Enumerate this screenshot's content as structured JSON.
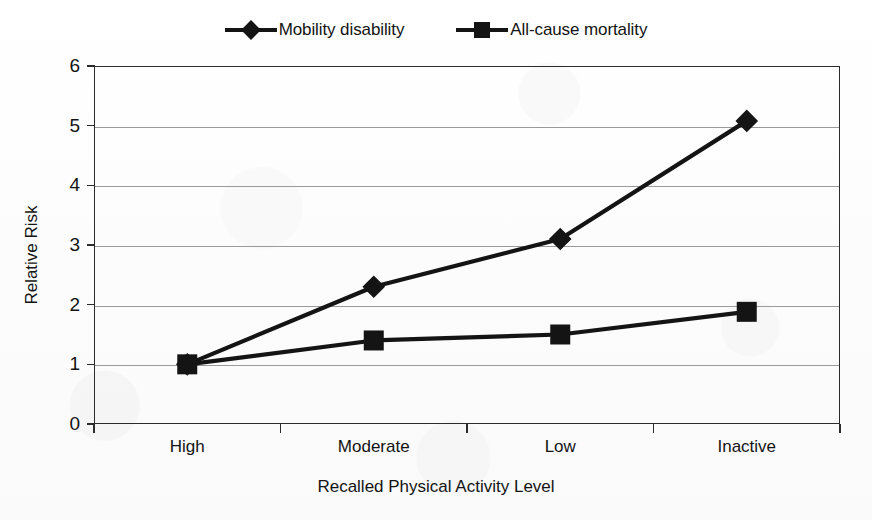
{
  "chart_data": {
    "type": "line",
    "title": "",
    "xlabel": "Recalled Physical Activity Level",
    "ylabel": "Relative Risk",
    "categories": [
      "High",
      "Moderate",
      "Low",
      "Inactive"
    ],
    "yticks": [
      0,
      1,
      2,
      3,
      4,
      5,
      6
    ],
    "ylim": [
      0,
      6
    ],
    "grid": true,
    "legend_position": "top-center",
    "series": [
      {
        "name": "Mobility disability",
        "marker": "diamond",
        "color": "#141414",
        "values": [
          1.0,
          2.3,
          3.1,
          5.08
        ]
      },
      {
        "name": "All-cause mortality",
        "marker": "square",
        "color": "#141414",
        "values": [
          1.0,
          1.4,
          1.5,
          1.88
        ]
      }
    ]
  },
  "legend": {
    "entries": [
      {
        "label": "Mobility disability",
        "marker": "diamond"
      },
      {
        "label": "All-cause mortality",
        "marker": "square"
      }
    ]
  },
  "axes": {
    "y_title": "Relative Risk",
    "x_title": "Recalled Physical Activity Level",
    "y_tick_labels": [
      "6",
      "5",
      "4",
      "3",
      "2",
      "1",
      "0"
    ],
    "x_tick_labels": [
      "High",
      "Moderate",
      "Low",
      "Inactive"
    ]
  },
  "colors": {
    "ink": "#141414",
    "grid": "#9a9a9a",
    "frame": "#2b2b2b",
    "paper": "#fdfdfd"
  }
}
